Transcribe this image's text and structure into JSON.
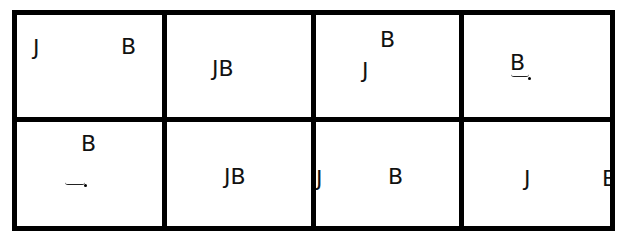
{
  "grid": {
    "rows": 2,
    "cols": 4,
    "line_color": "#000000",
    "background": "#ffffff"
  },
  "cells": [
    {
      "row": 1,
      "col": 1,
      "glyphs": [
        {
          "char": "J",
          "x": 33,
          "y": 37
        },
        {
          "char": "B",
          "x": 121,
          "y": 36
        }
      ]
    },
    {
      "row": 1,
      "col": 2,
      "glyphs": [
        {
          "char": "JB",
          "x": 212,
          "y": 58
        }
      ]
    },
    {
      "row": 1,
      "col": 3,
      "glyphs": [
        {
          "char": "B",
          "x": 380,
          "y": 29
        },
        {
          "char": "J",
          "x": 362,
          "y": 60
        }
      ]
    },
    {
      "row": 1,
      "col": 4,
      "glyphs": [
        {
          "char": "B",
          "x": 510,
          "y": 52
        }
      ],
      "mark": "hook-under-B"
    },
    {
      "row": 2,
      "col": 1,
      "glyphs": [
        {
          "char": "B",
          "x": 82,
          "y": 133
        }
      ],
      "mark": "hook-below-B"
    },
    {
      "row": 2,
      "col": 2,
      "glyphs": [
        {
          "char": "JB",
          "x": 224,
          "y": 166
        }
      ]
    },
    {
      "row": 2,
      "col": 3,
      "glyphs": [
        {
          "char": "J",
          "x": 316,
          "y": 168
        },
        {
          "char": "B",
          "x": 388,
          "y": 166
        }
      ]
    },
    {
      "row": 2,
      "col": 4,
      "glyphs": [
        {
          "char": "J",
          "x": 524,
          "y": 168
        },
        {
          "char": "B",
          "x": 602,
          "y": 168,
          "clipped": true
        }
      ]
    }
  ]
}
